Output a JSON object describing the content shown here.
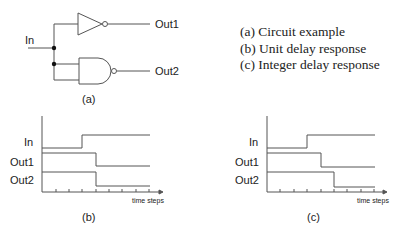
{
  "circuit": {
    "label": "(a)",
    "input_label": "In",
    "outputs": [
      "Out1",
      "Out2"
    ],
    "gates": [
      "inverter",
      "nand"
    ]
  },
  "legend": {
    "items": [
      "(a) Circuit example",
      "(b) Unit delay response",
      "(c) Integer delay response"
    ]
  },
  "timing_b": {
    "label": "(b)",
    "x_label": "time steps",
    "signals": [
      "In",
      "Out1",
      "Out2"
    ],
    "steps": {
      "In": 3,
      "Out1": 4,
      "Out2": 4
    }
  },
  "timing_c": {
    "label": "(c)",
    "x_label": "time steps",
    "signals": [
      "In",
      "Out1",
      "Out2"
    ],
    "steps": {
      "In": 3,
      "Out1": 4,
      "Out2": 5
    }
  },
  "colors": {
    "line": "#555555",
    "text": "#222222"
  }
}
